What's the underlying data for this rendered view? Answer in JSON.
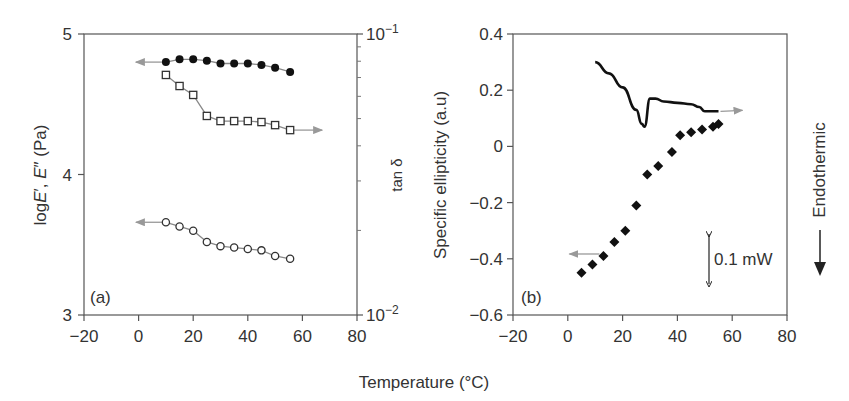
{
  "figure": {
    "xlabel": "Temperature (°C)"
  },
  "chart_data": [
    {
      "panel": "(a)",
      "type": "line",
      "title": "",
      "xlabel": "Temperature (°C)",
      "ylabel": "logE′, E″ (Pa)",
      "ylabel_right": "tan δ",
      "xlim": [
        -20,
        80
      ],
      "ylim": [
        3,
        5
      ],
      "ylim_right": [
        0.01,
        0.1
      ],
      "yscale_right": "log",
      "x_ticks": [
        -20,
        0,
        20,
        40,
        60,
        80
      ],
      "y_ticks": [
        3,
        4,
        5
      ],
      "y_ticks_right": [
        "10−2",
        "10−1"
      ],
      "grid": false,
      "series": [
        {
          "name": "E′ (filled circles)",
          "axis": "left",
          "marker": "filled-circle",
          "x": [
            10,
            15,
            20,
            25,
            30,
            35,
            40,
            45,
            50,
            55.5
          ],
          "values": [
            4.8,
            4.82,
            4.82,
            4.81,
            4.79,
            4.79,
            4.79,
            4.78,
            4.76,
            4.73
          ]
        },
        {
          "name": "tan δ (open squares)",
          "axis": "right",
          "marker": "open-square",
          "x": [
            10,
            15,
            20,
            25,
            30,
            35,
            40,
            45,
            50,
            55.5
          ],
          "values": [
            0.0715,
            0.0653,
            0.0607,
            0.0511,
            0.049,
            0.049,
            0.049,
            0.0486,
            0.0474,
            0.0455
          ]
        },
        {
          "name": "E″ (open circles)",
          "axis": "left",
          "marker": "open-circle",
          "x": [
            10,
            15,
            20,
            25,
            30,
            35,
            40,
            45,
            50,
            55.5
          ],
          "values": [
            3.66,
            3.63,
            3.6,
            3.52,
            3.49,
            3.48,
            3.47,
            3.46,
            3.42,
            3.4
          ]
        }
      ]
    },
    {
      "panel": "(b)",
      "type": "scatter",
      "title": "",
      "xlabel": "Temperature (°C)",
      "ylabel": "Specific ellipticity (a.u)",
      "ylabel_right": "← Endothermic",
      "xlim": [
        -20,
        80
      ],
      "ylim": [
        -0.6,
        0.4
      ],
      "x_ticks": [
        -20,
        0,
        20,
        40,
        60,
        80
      ],
      "y_ticks": [
        -0.6,
        -0.4,
        -0.2,
        0,
        0.2,
        0.4
      ],
      "grid": false,
      "annotations": [
        "0.1 mW"
      ],
      "series": [
        {
          "name": "Specific ellipticity (diamonds)",
          "axis": "left",
          "marker": "filled-diamond",
          "x": [
            5,
            9,
            13,
            17,
            21,
            25,
            29,
            33,
            38,
            41,
            45,
            49,
            53,
            55
          ],
          "values": [
            -0.45,
            -0.42,
            -0.39,
            -0.34,
            -0.3,
            -0.21,
            -0.1,
            -0.07,
            -0.02,
            0.04,
            0.05,
            0.06,
            0.07,
            0.08
          ]
        },
        {
          "name": "DSC thermogram (solid line)",
          "axis": "right",
          "marker": "line",
          "x": [
            10,
            15,
            20,
            25,
            27,
            28,
            30,
            32,
            35,
            40,
            45,
            48,
            50,
            55
          ],
          "values": [
            0.3,
            0.26,
            0.21,
            0.13,
            0.08,
            0.07,
            0.17,
            0.17,
            0.16,
            0.155,
            0.15,
            0.14,
            0.125,
            0.125
          ]
        }
      ]
    }
  ]
}
